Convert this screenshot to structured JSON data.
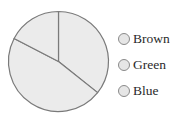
{
  "chart_data": {
    "type": "pie",
    "title": "",
    "categories": [
      "Slice A",
      "Slice B",
      "Slice C"
    ],
    "values": [
      35.7,
      46.9,
      17.4
    ],
    "start_angle_deg": 0,
    "direction": "clockwise",
    "slice_fill": "#ebebeb",
    "slice_stroke": "#7a7a7a",
    "center": [
      58.5,
      61.5
    ],
    "radius": 50,
    "legend": {
      "position": "right",
      "entries": [
        "Brown",
        "Green",
        "Blue"
      ],
      "marker": "circle",
      "marker_fill": "#e6e6e6",
      "marker_stroke": "#8a8a8a"
    },
    "slice_labels": []
  },
  "legend": {
    "items": [
      {
        "label": "Brown"
      },
      {
        "label": "Green"
      },
      {
        "label": "Blue"
      }
    ]
  }
}
